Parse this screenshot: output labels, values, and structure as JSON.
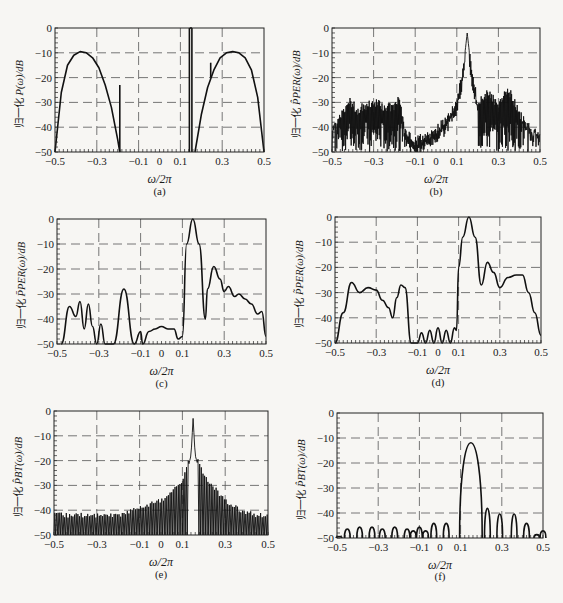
{
  "figure": {
    "panels": [
      {
        "id": "a",
        "caption": "(a)",
        "ylabel_cn": "归一化",
        "ylabel_math": "P(ω)/dB"
      },
      {
        "id": "b",
        "caption": "(b)",
        "ylabel_cn": "归一化",
        "ylabel_math": "P̂PER(ω)/dB"
      },
      {
        "id": "c",
        "caption": "(c)",
        "ylabel_cn": "归一化",
        "ylabel_math": "P̄PER(ω)/dB"
      },
      {
        "id": "d",
        "caption": "(d)",
        "ylabel_cn": "归一化",
        "ylabel_math": "P̃PER(ω)/dB"
      },
      {
        "id": "e",
        "caption": "(e)",
        "ylabel_cn": "归一化",
        "ylabel_math": "P̂BT(ω)/dB"
      },
      {
        "id": "f",
        "caption": "(f)",
        "ylabel_cn": "归一化",
        "ylabel_math": "P̂BT(ω)/dB"
      }
    ],
    "xlabel": "ω/2π",
    "xticks": [
      "-0.5",
      "-0.3",
      "-0.1",
      "0",
      "0.1",
      "0.3",
      "0.5"
    ],
    "yticks": [
      "0",
      "-10",
      "-20",
      "-30",
      "-40",
      "-50"
    ]
  },
  "chart_data": [
    {
      "panel": "a",
      "type": "line",
      "title": "",
      "xlabel": "ω/2π",
      "ylabel": "归一化 P(ω)/dB",
      "xlim": [
        -0.5,
        0.5
      ],
      "ylim": [
        -50,
        0
      ],
      "grid": true,
      "series": [
        {
          "name": "AR broad peak (left)",
          "x": [
            -0.5,
            -0.47,
            -0.44,
            -0.41,
            -0.38,
            -0.35,
            -0.32,
            -0.29,
            -0.26,
            -0.23,
            -0.2,
            -0.19
          ],
          "y": [
            -50,
            -26,
            -15,
            -11,
            -9.5,
            -10,
            -12,
            -16,
            -23,
            -32,
            -45,
            -50
          ]
        },
        {
          "name": "line component",
          "x": [
            -0.19,
            -0.19
          ],
          "y": [
            -50,
            -23
          ]
        },
        {
          "name": "sinusoid pair",
          "x": [
            0.145,
            0.155
          ],
          "y": [
            0,
            0
          ]
        },
        {
          "name": "AR broad peak (right)",
          "x": [
            0.17,
            0.2,
            0.23,
            0.26,
            0.29,
            0.32,
            0.35,
            0.38,
            0.41,
            0.44,
            0.47,
            0.5
          ],
          "y": [
            -50,
            -35,
            -24,
            -17,
            -12,
            -10,
            -9.5,
            -10,
            -12,
            -17,
            -28,
            -50
          ]
        },
        {
          "name": "line component",
          "x": [
            0.245,
            0.245
          ],
          "y": [
            -20,
            -14
          ]
        }
      ]
    },
    {
      "panel": "b",
      "type": "line",
      "xlabel": "ω/2π",
      "ylabel": "归一化 P̂PER(ω)/dB",
      "xlim": [
        -0.5,
        0.5
      ],
      "ylim": [
        -50,
        0
      ],
      "grid": true,
      "series": [
        {
          "name": "periodogram envelope",
          "x": [
            -0.5,
            -0.45,
            -0.42,
            -0.38,
            -0.3,
            -0.2,
            -0.18,
            -0.15,
            -0.1,
            0,
            0.05,
            0.1,
            0.13,
            0.15,
            0.17,
            0.2,
            0.25,
            0.3,
            0.35,
            0.4,
            0.45,
            0.5
          ],
          "y": [
            -40,
            -33,
            -27,
            -31,
            -28,
            -31,
            -25,
            -40,
            -44,
            -39,
            -35,
            -28,
            -15,
            0,
            -15,
            -28,
            -24,
            -29,
            -23,
            -32,
            -40,
            -42
          ]
        },
        {
          "name": "floor",
          "x": [
            -0.5,
            -0.15,
            0.2,
            0.5
          ],
          "y": [
            -50,
            -45,
            -50,
            -50
          ]
        }
      ]
    },
    {
      "panel": "c",
      "type": "line",
      "xlabel": "ω/2π",
      "ylabel": "归一化 P̄PER(ω)/dB",
      "xlim": [
        -0.5,
        0.5
      ],
      "ylim": [
        -50,
        0
      ],
      "grid": true,
      "series": [
        {
          "name": "Bartlett average",
          "x": [
            -0.48,
            -0.44,
            -0.41,
            -0.39,
            -0.37,
            -0.35,
            -0.33,
            -0.31,
            -0.29,
            -0.27,
            -0.25,
            -0.23,
            -0.18,
            -0.13,
            -0.1,
            -0.09,
            -0.06,
            -0.03,
            0,
            0.03,
            0.06,
            0.08,
            0.1,
            0.12,
            0.15,
            0.18,
            0.21,
            0.22,
            0.25,
            0.28,
            0.3,
            0.32,
            0.35,
            0.37,
            0.4,
            0.43,
            0.46,
            0.48,
            0.5
          ],
          "y": [
            -50,
            -35,
            -39,
            -33,
            -44,
            -34,
            -43,
            -50,
            -42,
            -50,
            -50,
            -50,
            -28,
            -50,
            -45,
            -50,
            -45,
            -44,
            -43,
            -44,
            -44,
            -48,
            -47,
            -10,
            0,
            -10,
            -40,
            -28,
            -19,
            -24,
            -29,
            -27,
            -31,
            -30,
            -32,
            -34,
            -38,
            -37,
            -47
          ]
        }
      ]
    },
    {
      "panel": "d",
      "type": "line",
      "xlabel": "ω/2π",
      "ylabel": "归一化 P̃PER(ω)/dB",
      "xlim": [
        -0.5,
        0.5
      ],
      "ylim": [
        -50,
        0
      ],
      "grid": true,
      "series": [
        {
          "name": "Welch average",
          "x": [
            -0.5,
            -0.46,
            -0.42,
            -0.38,
            -0.34,
            -0.3,
            -0.27,
            -0.24,
            -0.22,
            -0.2,
            -0.18,
            -0.16,
            -0.13,
            -0.1,
            -0.08,
            -0.06,
            -0.04,
            -0.02,
            0,
            0.02,
            0.04,
            0.06,
            0.08,
            0.09,
            0.1,
            0.12,
            0.15,
            0.18,
            0.21,
            0.24,
            0.27,
            0.3,
            0.34,
            0.38,
            0.41,
            0.44,
            0.47,
            0.5
          ],
          "y": [
            -50,
            -38,
            -26,
            -30,
            -28,
            -29,
            -33,
            -36,
            -40,
            -32,
            -27,
            -28,
            -50,
            -50,
            -46,
            -50,
            -45,
            -50,
            -44,
            -50,
            -45,
            -50,
            -44,
            -45,
            -20,
            -8,
            0,
            -8,
            -27,
            -18,
            -22,
            -28,
            -24,
            -23,
            -23,
            -30,
            -38,
            -47
          ]
        }
      ]
    },
    {
      "panel": "e",
      "type": "line",
      "xlabel": "ω/2π",
      "ylabel": "归一化 P̂BT(ω)/dB",
      "xlim": [
        -0.5,
        0.5
      ],
      "ylim": [
        -50,
        0
      ],
      "grid": true,
      "series": [
        {
          "name": "BT envelope (peaks)",
          "x": [
            -0.5,
            -0.4,
            -0.3,
            -0.2,
            -0.1,
            0,
            0.05,
            0.1,
            0.12,
            0.14,
            0.15,
            0.16,
            0.18,
            0.2,
            0.25,
            0.3,
            0.35,
            0.4,
            0.45,
            0.5
          ],
          "y": [
            -41,
            -41,
            -41,
            -41,
            -38,
            -35,
            -32,
            -27,
            -22,
            -15,
            0,
            -15,
            -21,
            -25,
            -30,
            -35,
            -38,
            -40,
            -41,
            -41
          ]
        },
        {
          "name": "BT floor",
          "x": [
            -0.5,
            0.5
          ],
          "y": [
            -50,
            -50
          ]
        }
      ]
    },
    {
      "panel": "f",
      "type": "line",
      "xlabel": "ω/2π",
      "ylabel": "归一化 P̂BT(ω)/dB",
      "xlim": [
        -0.5,
        0.5
      ],
      "ylim": [
        -50,
        0
      ],
      "grid": true,
      "series": [
        {
          "name": "BT (windowed) side-lobes peaks",
          "x": [
            -0.49,
            -0.45,
            -0.39,
            -0.33,
            -0.28,
            -0.22,
            -0.16,
            -0.13,
            -0.1,
            -0.07,
            -0.03,
            0.03,
            0.15,
            0.23,
            0.29,
            0.36,
            0.42,
            0.47,
            0.5
          ],
          "y": [
            -50,
            -46,
            -45,
            -45,
            -46,
            -45,
            -46,
            -47,
            -45,
            -47,
            -43,
            -43,
            0,
            -35,
            -38,
            -38,
            -43,
            -49,
            -47
          ]
        }
      ]
    }
  ]
}
